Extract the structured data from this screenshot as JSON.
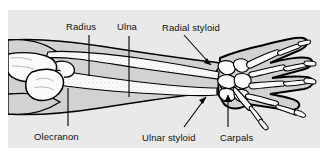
{
  "figure": {
    "background_color": "#e9e9e9",
    "page_color": "#ffffff",
    "bone_color": "#fbfbfb",
    "soft_tissue_color": "#d2d2d2",
    "outline_color": "#000000",
    "label_color": "#111111"
  },
  "labels": [
    {
      "id": "radius",
      "text": "Radius",
      "x": 66,
      "y": 22
    },
    {
      "id": "ulna",
      "text": "Ulna",
      "x": 117,
      "y": 22
    },
    {
      "id": "radial-styloid",
      "text": "Radial styloid",
      "x": 162,
      "y": 23
    },
    {
      "id": "olecranon",
      "text": "Olecranon",
      "x": 34,
      "y": 132
    },
    {
      "id": "ulnar-styloid",
      "text": "Ulnar styloid",
      "x": 142,
      "y": 133
    },
    {
      "id": "carpals",
      "text": "Carpals",
      "x": 220,
      "y": 133
    }
  ],
  "leaders": [
    {
      "id": "leader-radius",
      "type": "line",
      "points": "89,35 89,76"
    },
    {
      "id": "leader-ulna",
      "type": "line",
      "points": "129,36 129,97"
    },
    {
      "id": "leader-radial-styloid",
      "type": "arrow",
      "points": "184,35 213,66"
    },
    {
      "id": "leader-olecranon",
      "type": "line",
      "points": "68,126 68,88"
    },
    {
      "id": "leader-ulnar-styloid",
      "type": "arrow",
      "points": "184,127 206,96"
    },
    {
      "id": "leader-carpals",
      "type": "arrow",
      "points": "228,127 228,94"
    }
  ],
  "structures": [
    {
      "id": "humerus-distal",
      "name": "Distal humerus"
    },
    {
      "id": "olecranon-process",
      "name": "Olecranon process"
    },
    {
      "id": "radius-bone",
      "name": "Radius"
    },
    {
      "id": "ulna-bone",
      "name": "Ulna"
    },
    {
      "id": "carpal-bones",
      "name": "Carpals"
    },
    {
      "id": "metacarpals",
      "name": "Metacarpals"
    },
    {
      "id": "phalanges",
      "name": "Phalanges"
    },
    {
      "id": "soft-tissue-outline",
      "name": "Arm soft tissue outline"
    }
  ]
}
